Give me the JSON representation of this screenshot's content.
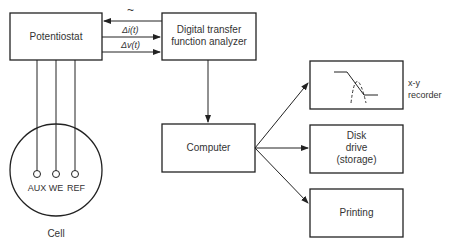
{
  "diagram": {
    "nodes": {
      "potentiostat": {
        "label": "Potentiostat"
      },
      "analyzer": {
        "label": "Digital transfer function analyzer"
      },
      "computer": {
        "label": "Computer"
      },
      "recorder": {
        "label": "x-y recorder"
      },
      "disk": {
        "label": "Disk drive (storage)"
      },
      "printing": {
        "label": "Printing"
      },
      "cell": {
        "label": "Cell",
        "electrodes": [
          "AUX",
          "WE",
          "REF"
        ]
      }
    },
    "signals": {
      "perturbation": "~",
      "current": "Δi(t)",
      "voltage": "Δv(t)"
    },
    "edges": [
      {
        "from": "analyzer",
        "to": "potentiostat",
        "label": "~"
      },
      {
        "from": "potentiostat",
        "to": "analyzer",
        "label": "Δi(t)"
      },
      {
        "from": "potentiostat",
        "to": "analyzer",
        "label": "Δv(t)"
      },
      {
        "from": "analyzer",
        "to": "computer"
      },
      {
        "from": "computer",
        "to": "recorder"
      },
      {
        "from": "computer",
        "to": "disk"
      },
      {
        "from": "computer",
        "to": "printing"
      },
      {
        "from": "potentiostat",
        "to": "cell"
      }
    ]
  }
}
